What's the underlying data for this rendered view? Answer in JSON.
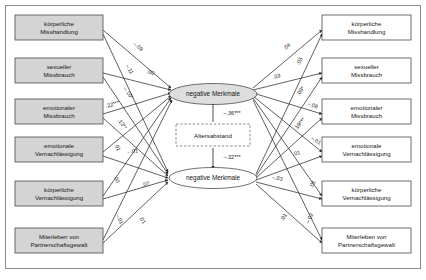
{
  "figure": {
    "background": "#ffffff",
    "frame_color": "#8a8a8a",
    "box_fill_left": "#d4d4d4",
    "box_fill_right": "#ffffff",
    "box_stroke": "#4a4a4a",
    "ellipse_fill": "#dedede",
    "ellipse_stroke": "#4a4a4a",
    "line_color": "#2b2b2b"
  },
  "left_nodes": [
    {
      "id": "l1",
      "line1": "körperliche",
      "line2": "Misshandlung"
    },
    {
      "id": "l2",
      "line1": "sexueller",
      "line2": "Missbrauch"
    },
    {
      "id": "l3",
      "line1": "emotionaler",
      "line2": "Missbrauch"
    },
    {
      "id": "l4",
      "line1": "emotionale",
      "line2": "Vernachlässigung"
    },
    {
      "id": "l5",
      "line1": "körperliche",
      "line2": "Vernachlässigung"
    },
    {
      "id": "l6",
      "line1": "Miterleben von",
      "line2": "Partnerschaftsgewalt"
    }
  ],
  "right_nodes": [
    {
      "id": "r1",
      "line1": "körperliche",
      "line2": "Misshandlung"
    },
    {
      "id": "r2",
      "line1": "sexueller",
      "line2": "Missbrauch"
    },
    {
      "id": "r3",
      "line1": "emotionaler",
      "line2": "Missbrauch"
    },
    {
      "id": "r4",
      "line1": "emotionale",
      "line2": "Vernachlässigung"
    },
    {
      "id": "r5",
      "line1": "körperliche",
      "line2": "Vernachlässigung"
    },
    {
      "id": "r6",
      "line1": "Miterleben von",
      "line2": "Partnerschaftsgewalt"
    }
  ],
  "latents": {
    "top": "negative Merkmale",
    "bottom": "negative Merkmale",
    "mediator": "Altersabstand"
  },
  "mediator_paths": {
    "top_coefficient": "–.36***",
    "bottom_coefficient": "–.32***"
  },
  "left_coefficients": [
    {
      "id": "lc1",
      "value": "–.09"
    },
    {
      "id": "lc2",
      "value": "–.11"
    },
    {
      "id": "lc3",
      "value": ".00"
    },
    {
      "id": "lc4",
      "value": "–.10*"
    },
    {
      "id": "lc5",
      "value": ".22***"
    },
    {
      "id": "lc6",
      "value": ".13**"
    },
    {
      "id": "lc7",
      "value": ".01"
    },
    {
      "id": "lc8",
      "value": "–.01"
    },
    {
      "id": "lc9",
      "value": ".00"
    },
    {
      "id": "lc10",
      "value": ".07"
    },
    {
      "id": "lc11",
      "value": "–.01"
    },
    {
      "id": "lc12",
      "value": ".01"
    }
  ],
  "right_coefficients": [
    {
      "id": "rc1",
      "value": ".04"
    },
    {
      "id": "rc2",
      "value": ".03"
    },
    {
      "id": "rc3",
      "value": ".03"
    },
    {
      "id": "rc4",
      "value": ".09*"
    },
    {
      "id": "rc5",
      "value": "–.08"
    },
    {
      "id": "rc6",
      "value": ".19***"
    },
    {
      "id": "rc7",
      "value": "–.01"
    },
    {
      "id": "rc8",
      "value": ".01"
    },
    {
      "id": "rc9",
      "value": "–.03"
    },
    {
      "id": "rc10",
      "value": ".01"
    },
    {
      "id": "rc11",
      "value": ".01"
    },
    {
      "id": "rc12",
      "value": "–.02"
    }
  ]
}
